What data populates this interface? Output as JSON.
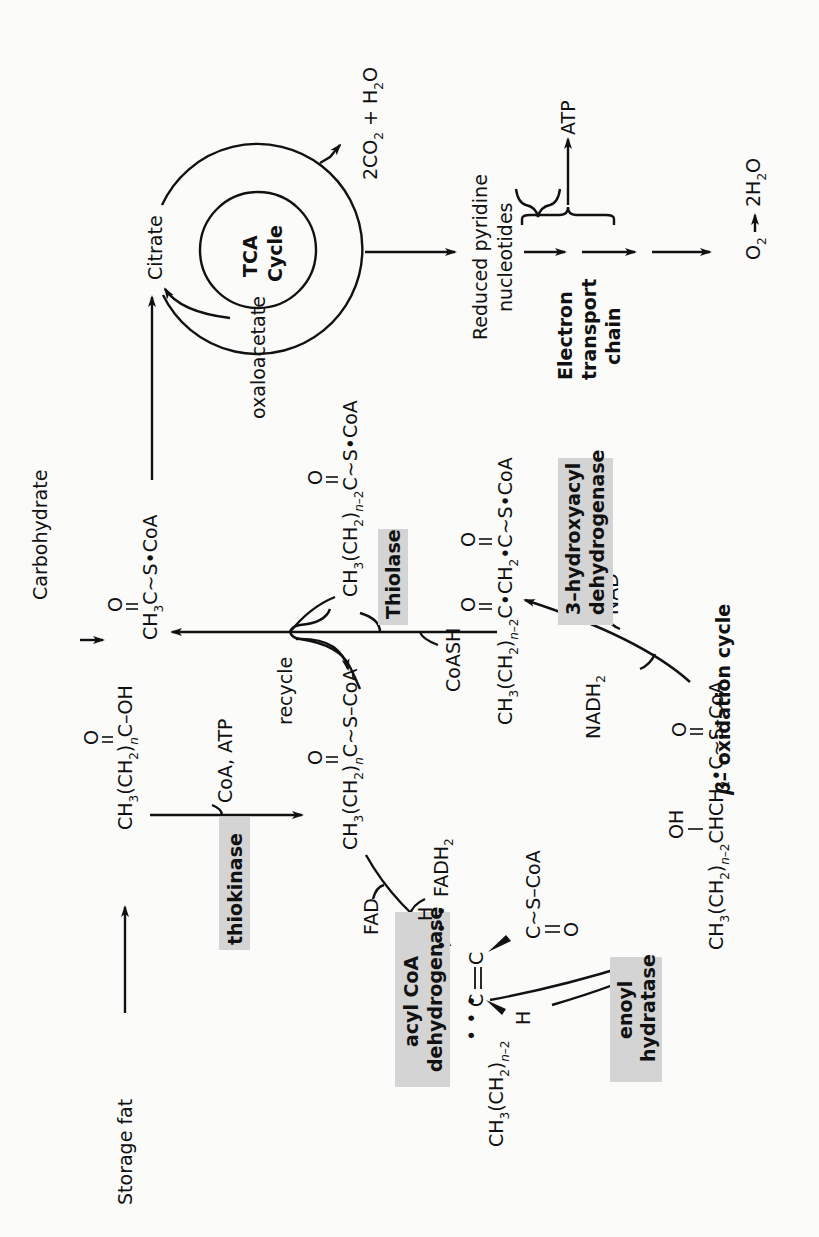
{
  "figure": {
    "orientation": "rotated 90° counterclockwise",
    "inputs": {
      "storage_fat": "Storage fat",
      "carbohydrate": "Carbohydrate"
    },
    "compounds": {
      "fatty_acid": "CH3(CH2)nC(=O)–OH",
      "fatty_acyl_coa": "CH3(CH2)nC(=O)~S–CoA",
      "trans_enoyl_coa": "CH3(CH2)n-2 C=C (H, H) C(=O)~S–CoA",
      "hydroxyacyl_coa": "CH3(CH2)n-2 CH(OH) CH2·C(=O)~S–CoA",
      "ketoacyl_coa": "CH3(CH2)n-2 C(=O)·CH2·C(=O)~S·CoA",
      "shortened_acyl_coa": "CH3(CH2)n-2 C(=O)~S·CoA",
      "acetyl_coa": "CH3C(=O)~S·CoA"
    },
    "enzymes": {
      "thiokinase": "thiokinase",
      "acyl_coa_dehydrogenase_1": "acyl CoA",
      "acyl_coa_dehydrogenase_2": "dehydrogenase",
      "enoyl_hydratase_1": "enoyl",
      "enoyl_hydratase_2": "hydratase",
      "hydroxyacyl_dehydrogenase_1": "3–hydroxyacyl",
      "hydroxyacyl_dehydrogenase_2": "dehydrogenase",
      "thiolase": "Thiolase"
    },
    "cofactors": {
      "coa_atp": "CoA, ATP",
      "fad": "FAD",
      "fadh2": "FADH",
      "fadh2_sub": "2",
      "nadh2": "NADH",
      "nadh2_sub": "2",
      "nad_plus": "NAD",
      "nad_plus_sup": "+",
      "coash": "CoASH",
      "recycle": "recycle"
    },
    "tca": {
      "label_line1": "TCA",
      "label_line2": "Cycle",
      "citrate": "Citrate",
      "oxaloacetate": "oxaloacetate",
      "products": "2CO2 + H2O"
    },
    "respiration": {
      "reduced_line1": "Reduced  pyridine",
      "reduced_line2": "nucleotides",
      "etc_line1": "Electron",
      "etc_line2": "transport",
      "etc_line3": "chain",
      "atp": "ATP",
      "o2": "O",
      "o2_sub": "2",
      "water": "2H",
      "water_sub": "2",
      "water_tail": "O"
    },
    "caption_beta": "β",
    "caption_rest": "– oxidation   cycle"
  }
}
